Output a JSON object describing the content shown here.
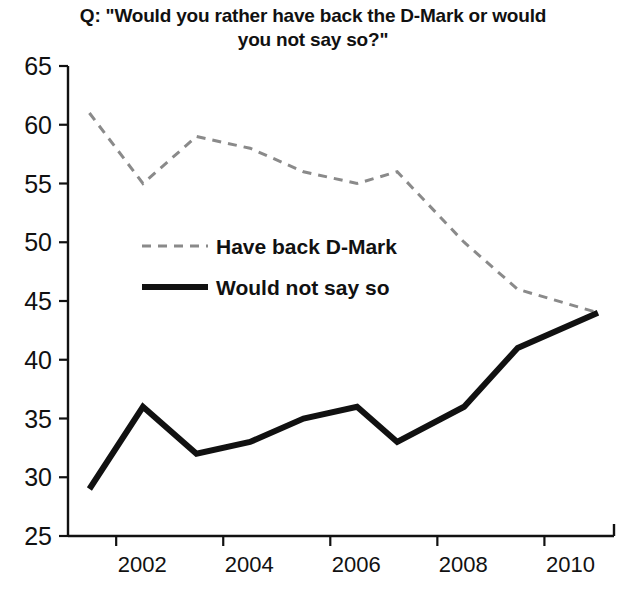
{
  "chart_data": {
    "type": "line",
    "title": "Q: \"Would you rather have back the D-Mark or would you not say so?\"",
    "title_line1": "Q: \"Would you rather have back the D-Mark or would",
    "title_line2": "you not say so?\"",
    "xlabel": "",
    "ylabel": "",
    "ylim": [
      25,
      65
    ],
    "ytick_values": [
      65,
      60,
      55,
      50,
      45,
      40,
      35,
      30,
      25
    ],
    "ytick_labels": [
      "65",
      "60",
      "55",
      "50",
      "45",
      "40",
      "35",
      "30",
      "25"
    ],
    "xtick_labels": [
      "2002",
      "2004",
      "2006",
      "2008",
      "2010"
    ],
    "xtick_values": [
      2002,
      2004,
      2006,
      2008,
      2010
    ],
    "xlim": [
      2001.1,
      2011.3
    ],
    "grid": false,
    "legend_position": "center-left inside plot",
    "x": [
      2001.5,
      2002.5,
      2003.5,
      2004.5,
      2005.5,
      2006.5,
      2007.25,
      2008.5,
      2009.5,
      2011.0
    ],
    "series": [
      {
        "name": "Have back D-Mark",
        "style": "dashed",
        "color": "#8a8a8a",
        "values": [
          61,
          55,
          59,
          58,
          56,
          55,
          56,
          50,
          46,
          44
        ]
      },
      {
        "name": "Would not say so",
        "style": "solid",
        "color": "#111111",
        "values": [
          29,
          36,
          32,
          33,
          35,
          36,
          33,
          36,
          41,
          44
        ]
      }
    ]
  },
  "legend": {
    "items": [
      {
        "label": "Have back D-Mark",
        "style": "dashed",
        "color": "#8a8a8a"
      },
      {
        "label": "Would not say so",
        "style": "solid",
        "color": "#111111"
      }
    ]
  },
  "colors": {
    "axis": "#111111",
    "dashed_series": "#8a8a8a",
    "solid_series": "#111111",
    "background": "#ffffff"
  }
}
